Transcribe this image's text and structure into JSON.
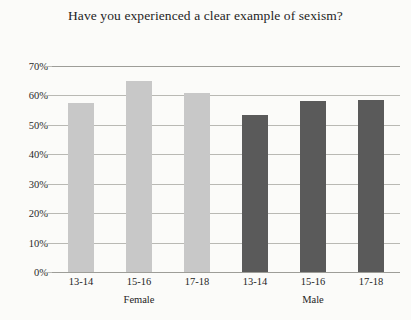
{
  "chart_data": {
    "type": "bar",
    "title": "Have you experienced a clear example of sexism?",
    "xlabel": "",
    "ylabel": "",
    "ylim": [
      0,
      70
    ],
    "ytick_labels": [
      "0%",
      "10%",
      "20%",
      "30%",
      "40%",
      "50%",
      "60%",
      "70%"
    ],
    "ytick_values": [
      0,
      10,
      20,
      30,
      40,
      50,
      60,
      70
    ],
    "grid": true,
    "legend": "none",
    "categories": [
      "13-14",
      "15-16",
      "17-18",
      "13-14",
      "15-16",
      "17-18"
    ],
    "groups": [
      {
        "name": "Female",
        "color": "#c8c8c8",
        "categories": [
          "13-14",
          "15-16",
          "17-18"
        ],
        "values": [
          57.5,
          65,
          61
        ]
      },
      {
        "name": "Male",
        "color": "#5a5a5a",
        "categories": [
          "13-14",
          "15-16",
          "17-18"
        ],
        "values": [
          53.5,
          58,
          58.5
        ]
      }
    ],
    "bars": [
      {
        "label": "13-14",
        "group": "Female",
        "value": 57.5,
        "color": "#c8c8c8"
      },
      {
        "label": "15-16",
        "group": "Female",
        "value": 65,
        "color": "#c8c8c8"
      },
      {
        "label": "17-18",
        "group": "Female",
        "value": 61,
        "color": "#c8c8c8"
      },
      {
        "label": "13-14",
        "group": "Male",
        "value": 53.5,
        "color": "#5a5a5a"
      },
      {
        "label": "15-16",
        "group": "Male",
        "value": 58,
        "color": "#5a5a5a"
      },
      {
        "label": "17-18",
        "group": "Male",
        "value": 58.5,
        "color": "#5a5a5a"
      }
    ],
    "colors": {
      "female_bar": "#c8c8c8",
      "male_bar": "#5a5a5a",
      "gridline": "#b9b9b4",
      "axis": "#9d9d98",
      "background": "#fbfbf9",
      "text": "#1e1e1e"
    }
  }
}
